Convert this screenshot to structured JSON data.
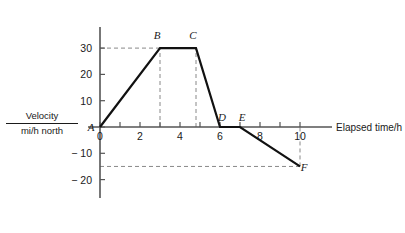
{
  "chart_data": {
    "type": "line",
    "title": "",
    "xlabel": "Elapsed time/h",
    "ylabel_numerator": "Velocity",
    "ylabel_denominator": "mi/h north",
    "xlim": [
      -0.6,
      11.6
    ],
    "ylim": [
      -27,
      38
    ],
    "xticks": [
      0,
      1,
      2,
      3,
      4,
      5,
      6,
      7,
      8,
      9,
      10
    ],
    "xtick_labels": [
      "0",
      "",
      "2",
      "",
      "4",
      "",
      "6",
      "",
      "8",
      "",
      "10"
    ],
    "yticks": [
      -20,
      -10,
      0,
      10,
      20,
      30
    ],
    "ytick_labels": [
      "− 20",
      "− 10",
      "",
      "10",
      "20",
      "30"
    ],
    "grid": false,
    "legend": "none",
    "line_color": "#111111",
    "axis_color": "#555555",
    "guide_color": "#888888",
    "series": [
      {
        "name": "velocity",
        "points": [
          {
            "label": "A",
            "x": 0,
            "y": 0,
            "label_dx": -9,
            "label_dy": 4
          },
          {
            "label": "B",
            "x": 3,
            "y": 30,
            "label_dx": -3,
            "label_dy": -9
          },
          {
            "label": "C",
            "x": 4.8,
            "y": 30,
            "label_dx": -3,
            "label_dy": -9
          },
          {
            "label": "D",
            "x": 6,
            "y": 0,
            "label_dx": 2,
            "label_dy": -6
          },
          {
            "label": "E",
            "x": 7,
            "y": 0,
            "label_dx": 2,
            "label_dy": -6
          },
          {
            "label": "F",
            "x": 10,
            "y": -15,
            "label_dx": 4,
            "label_dy": 5
          }
        ]
      }
    ],
    "guides": [
      {
        "name": "velocity-30-guide",
        "orientation": "horizontal",
        "value": 30,
        "from": 0,
        "to": 3
      },
      {
        "name": "time-3-guide",
        "orientation": "vertical",
        "value": 3,
        "from": 0,
        "to": 30
      },
      {
        "name": "time-4.8-guide",
        "orientation": "vertical",
        "value": 4.8,
        "from": 0,
        "to": 30
      },
      {
        "name": "velocity-minus15-guide",
        "orientation": "horizontal",
        "value": -15,
        "from": 0,
        "to": 10
      },
      {
        "name": "time-10-guide",
        "orientation": "vertical",
        "value": 10,
        "from": -15,
        "to": 0
      }
    ]
  }
}
